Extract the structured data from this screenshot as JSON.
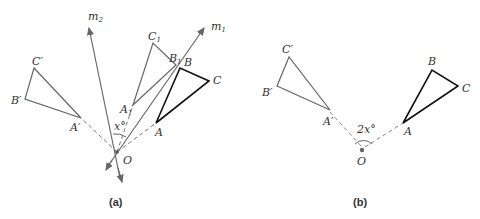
{
  "panels": [
    {
      "caption": "(a)",
      "labels": {
        "m2": "m",
        "m2_sub": "2",
        "m1": "m",
        "m1_sub": "1",
        "C1": "C",
        "C1_sub": "1",
        "B1": "B",
        "B1_sub": "1",
        "A1": "A",
        "A1_sub": "1",
        "B": "B",
        "C": "C",
        "A": "A",
        "Cp": "C′",
        "Bp": "B′",
        "Ap": "A′",
        "O": "O",
        "angle": "x°"
      }
    },
    {
      "caption": "(b)",
      "labels": {
        "Cp": "C′",
        "Bp": "B′",
        "Ap": "A′",
        "B": "B",
        "C": "C",
        "A": "A",
        "O": "O",
        "angle": "2x°"
      }
    }
  ],
  "colors": {
    "original_triangle": "#111111",
    "image_triangles": "#666666",
    "lines": "#6a6a6a",
    "dashed": "#777777"
  }
}
